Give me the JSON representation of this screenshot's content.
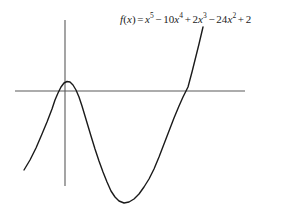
{
  "figure": {
    "background_color": "#ffffff",
    "axis_color": "#5a5a5a",
    "curve_color": "#1a1a1a",
    "text_color": "#1c1c1c"
  },
  "equation": {
    "full_text": "f(x) = x^5 - 10x^4 + 2x^3 - 24x^2 + 2",
    "fname": "f",
    "open_paren": "(",
    "arg": "x",
    "close_paren": ")",
    "equals": "=",
    "t1_var": "x",
    "t1_exp": "5",
    "op1": "−",
    "t2_coef": "10",
    "t2_var": "x",
    "t2_exp": "4",
    "op2": "+",
    "t3_coef": "2",
    "t3_var": "x",
    "t3_exp": "3",
    "op3": "−",
    "t4_coef": "24",
    "t4_var": "x",
    "t4_exp": "2",
    "op4": "+",
    "t5_const": "2"
  },
  "chart_data": {
    "type": "line",
    "xlabel": "",
    "ylabel": "",
    "grid": false,
    "legend": "none",
    "axes": {
      "x_axis_y_px": 91,
      "y_axis_x_px": 65,
      "x_axis_from_px": 15,
      "x_axis_to_px": 245,
      "y_axis_from_px": 20,
      "y_axis_to_px": 186,
      "tick_labels_x": [],
      "tick_labels_y": []
    },
    "function": "x^5 - 10x^4 + 2x^3 - 24x^2 + 2",
    "coefficients": [
      1,
      -10,
      2,
      -24,
      0,
      2
    ],
    "degree": 5,
    "features": {
      "local_maximum_px": [
        67,
        82
      ],
      "local_minimum_px": [
        124,
        203
      ],
      "x_intercepts_px": [
        55,
        78,
        188
      ]
    },
    "points_px": [
      [
        24,
        170
      ],
      [
        30,
        160
      ],
      [
        36,
        148
      ],
      [
        42,
        134
      ],
      [
        47,
        122
      ],
      [
        52,
        109
      ],
      [
        55,
        100
      ],
      [
        58,
        93
      ],
      [
        61,
        87
      ],
      [
        64,
        83
      ],
      [
        67,
        81.5
      ],
      [
        70,
        82
      ],
      [
        73,
        85
      ],
      [
        76,
        90
      ],
      [
        79,
        97
      ],
      [
        82,
        106
      ],
      [
        85,
        116
      ],
      [
        88,
        126
      ],
      [
        91,
        136
      ],
      [
        95,
        149
      ],
      [
        99,
        161
      ],
      [
        103,
        172
      ],
      [
        107,
        182
      ],
      [
        111,
        191
      ],
      [
        115,
        197
      ],
      [
        119,
        201
      ],
      [
        124,
        203
      ],
      [
        129,
        202
      ],
      [
        134,
        199
      ],
      [
        139,
        194
      ],
      [
        144,
        187
      ],
      [
        149,
        179
      ],
      [
        154,
        169
      ],
      [
        159,
        157
      ],
      [
        164,
        144
      ],
      [
        169,
        131
      ],
      [
        174,
        118
      ],
      [
        179,
        106
      ],
      [
        183,
        97
      ],
      [
        188,
        87
      ],
      [
        192,
        72
      ],
      [
        196,
        56
      ],
      [
        199,
        44
      ],
      [
        203,
        27
      ]
    ]
  }
}
